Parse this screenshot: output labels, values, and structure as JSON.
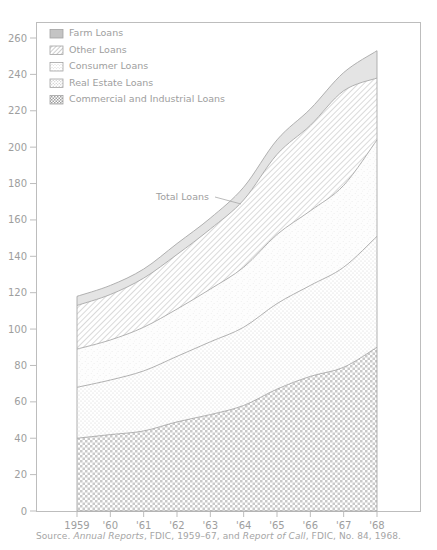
{
  "chart_data": {
    "type": "area",
    "title": "",
    "xlabel": "",
    "ylabel": "",
    "stacked": true,
    "grid": false,
    "legend_position": "top-left",
    "xlim": [
      1959,
      1968
    ],
    "ylim": [
      0,
      260
    ],
    "ytick_step": 20,
    "yticks": [
      0,
      20,
      40,
      60,
      80,
      100,
      120,
      140,
      160,
      180,
      200,
      220,
      240,
      260
    ],
    "ytick_labels": [
      "0",
      "20",
      "40",
      "60",
      "80",
      "100",
      "120",
      "140",
      "160",
      "180",
      "200",
      "220",
      "240",
      "260"
    ],
    "x": [
      1959,
      1960,
      1961,
      1962,
      1963,
      1964,
      1965,
      1966,
      1967,
      1968
    ],
    "categories": [
      "1959",
      "'60",
      "'61",
      "'62",
      "'63",
      "'64",
      "'65",
      "'66",
      "'67",
      "'68"
    ],
    "series": [
      {
        "name": "Commercial and Industrial Loans",
        "pattern": "checkerboard",
        "values": [
          40,
          42,
          44,
          49,
          53,
          58,
          67,
          74,
          79,
          90
        ]
      },
      {
        "name": "Real Estate Loans",
        "pattern": "fine-dots",
        "values": [
          28,
          30,
          33,
          36,
          40,
          43,
          47,
          50,
          55,
          61
        ]
      },
      {
        "name": "Consumer Loans",
        "pattern": "stipple",
        "values": [
          21,
          22,
          24,
          26,
          29,
          33,
          38,
          41,
          45,
          53
        ]
      },
      {
        "name": "Other Loans",
        "pattern": "diagonal-hatch",
        "values": [
          24,
          25,
          27,
          30,
          33,
          37,
          44,
          47,
          52,
          34
        ]
      },
      {
        "name": "Farm Loans",
        "pattern": "solid-light",
        "values": [
          5,
          5,
          5,
          6,
          6,
          7,
          8,
          9,
          10,
          15
        ]
      }
    ],
    "totals": [
      118,
      124,
      133,
      147,
      161,
      178,
      204,
      221,
      241,
      253
    ],
    "annotations": [
      {
        "text": "Total Loans",
        "x": 1962.0,
        "y": 178,
        "leader": true
      }
    ]
  },
  "legend": {
    "items": [
      {
        "label": "Farm Loans",
        "swatch": "swatch-farm"
      },
      {
        "label": "Other Loans",
        "swatch": "swatch-other"
      },
      {
        "label": "Consumer Loans",
        "swatch": "swatch-consumer"
      },
      {
        "label": "Real Estate Loans",
        "swatch": "swatch-real-estate"
      },
      {
        "label": "Commercial and Industrial Loans",
        "swatch": "swatch-commercial"
      }
    ]
  },
  "source": {
    "prefix": "Source.",
    "italic1": "Annual Reports",
    "mid": ", FDIC, 1959–67, and",
    "italic2": "Report of Call",
    "suffix": ", FDIC, No. 84, 1968."
  },
  "colors": {
    "frame": "#bdbdbd",
    "text": "#9e9e9e",
    "band_stroke": "#a8a8a8",
    "pattern": "#b5b5b5"
  }
}
